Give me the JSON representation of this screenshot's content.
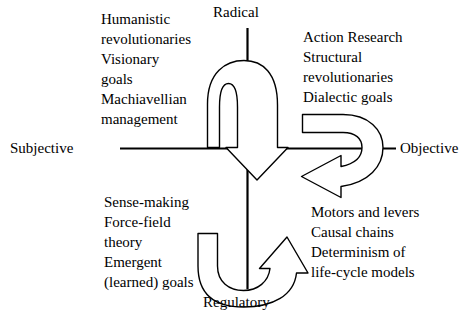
{
  "figure": {
    "type": "quadrant-framework-diagram",
    "axes": {
      "horizontal": {
        "left_label": "Subjective",
        "right_label": "Objective"
      },
      "vertical": {
        "top_label": "Radical",
        "bottom_label": "Regulatory"
      }
    },
    "quadrants": [
      {
        "id": "top-left",
        "position": "radical-subjective",
        "text": "Humanistic\nrevolutionaries\nVisionary\ngoals\nMachiavellian\nmanagement",
        "lines": [
          "Humanistic",
          "revolutionaries",
          "Visionary",
          "goals",
          "Machiavellian",
          "management"
        ]
      },
      {
        "id": "top-right",
        "position": "radical-objective",
        "text": "Action Research\nStructural\nrevolutionaries\nDialectic goals",
        "lines": [
          "Action Research",
          "Structural",
          "revolutionaries",
          "Dialectic goals"
        ]
      },
      {
        "id": "bottom-left",
        "position": "regulatory-subjective",
        "text": "Sense-making\nForce-field\ntheory\nEmergent\n(learned) goals",
        "lines": [
          "Sense-making",
          "Force-field",
          "theory",
          "Emergent",
          "(learned) goals"
        ]
      },
      {
        "id": "bottom-right",
        "position": "regulatory-objective",
        "text": "Motors and levers\nCausal chains\nDeterminism of\nlife-cycle models",
        "lines": [
          "Motors and levers",
          "Causal chains",
          "Determinism of",
          "life-cycle models"
        ]
      }
    ],
    "arrows": [
      {
        "id": "arrow-top-left-to-center",
        "name": "subjective-radical-inward-arrow",
        "shape": "arched-block-arrow",
        "points_to": "down-through-origin"
      },
      {
        "id": "arrow-right-recurve",
        "name": "objective-radical-recurve-arrow",
        "shape": "curved-block-arrow",
        "points_to": "down-left"
      },
      {
        "id": "arrow-bottom-u",
        "name": "regulatory-u-turn-arrow",
        "shape": "u-turn-block-arrow",
        "points_to": "up-right"
      }
    ],
    "colors": {
      "background": "#ffffff",
      "stroke": "#000000",
      "text": "#000000"
    }
  }
}
